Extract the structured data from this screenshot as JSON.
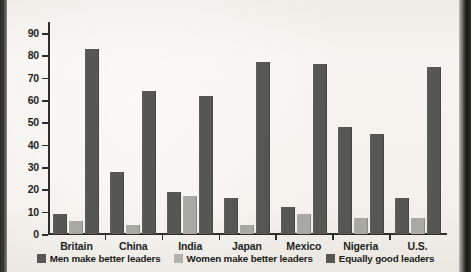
{
  "chart_data": {
    "type": "bar",
    "title": "",
    "subtitle": "",
    "xlabel": "",
    "ylabel": "",
    "ylim": [
      0,
      90
    ],
    "yticks": [
      0,
      10,
      20,
      30,
      40,
      50,
      60,
      70,
      80,
      90
    ],
    "grid": false,
    "legend_position": "bottom",
    "categories": [
      "Britain",
      "China",
      "India",
      "Japan",
      "Mexico",
      "Nigeria",
      "U.S."
    ],
    "series": [
      {
        "name": "Men make better leaders",
        "color": "#565654",
        "values": [
          9,
          28,
          19,
          16,
          12,
          48,
          16
        ]
      },
      {
        "name": "Women make better leaders",
        "color": "#b2b2ad",
        "values": [
          6,
          4,
          17,
          4,
          9,
          7,
          7
        ]
      },
      {
        "name": "Equally good leaders",
        "color": "#565654",
        "values": [
          83,
          64,
          62,
          77,
          76,
          45,
          75
        ]
      }
    ]
  },
  "axis": {
    "y_tick_labels": [
      "0",
      "10",
      "20",
      "30",
      "40",
      "50",
      "60",
      "70",
      "80",
      "90"
    ]
  },
  "legend": {
    "items": [
      {
        "label": "Men make better leaders",
        "swatch": "dark"
      },
      {
        "label": "Women make better leaders",
        "swatch": "light"
      },
      {
        "label": "Equally good leaders",
        "swatch": "dark"
      }
    ]
  }
}
